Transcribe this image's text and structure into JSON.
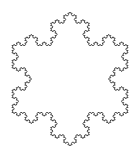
{
  "figure": {
    "type": "koch-snowflake",
    "depth": 4,
    "center": [
      70,
      79
    ],
    "tip_radius": 67,
    "stroke_color": "#444444",
    "stroke_width": 1,
    "background": "#ffffff"
  }
}
